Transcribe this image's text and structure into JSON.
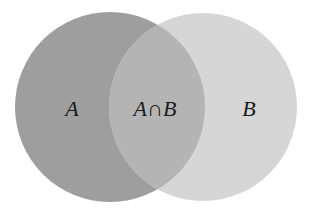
{
  "diagram": {
    "type": "venn",
    "sets": [
      {
        "id": "A",
        "label": "A",
        "color": "#9e9e9e"
      },
      {
        "id": "B",
        "label": "B",
        "color": "#d6d6d6"
      }
    ],
    "intersection": {
      "label": "A∩B",
      "color": "#b4b4b4"
    }
  }
}
